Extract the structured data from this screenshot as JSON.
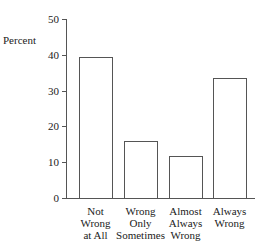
{
  "chart_data": {
    "type": "bar",
    "title": "",
    "xlabel": "",
    "ylabel": "Percent",
    "ylim": [
      0,
      50
    ],
    "yticks": [
      0,
      10,
      20,
      30,
      40,
      50
    ],
    "grid": false,
    "legend": null,
    "categories": [
      "Not Wrong at All",
      "Wrong Only Sometimes",
      "Almost Always Wrong",
      "Always Wrong"
    ],
    "category_lines": [
      [
        "Not",
        "Wrong",
        "at All"
      ],
      [
        "Wrong",
        "Only",
        "Sometimes"
      ],
      [
        "Almost",
        "Always",
        "Wrong"
      ],
      [
        "Always",
        "Wrong"
      ]
    ],
    "values": [
      39.3,
      16,
      11.7,
      33.4
    ],
    "colors": {
      "bar_fill": "#ffffff",
      "bar_stroke": "#555555",
      "axis": "#555555"
    }
  }
}
